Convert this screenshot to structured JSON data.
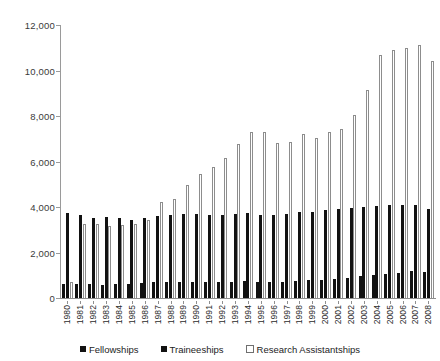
{
  "chart_data": {
    "type": "bar",
    "title": "",
    "xlabel": "",
    "ylabel": "",
    "ylim": [
      0,
      12000
    ],
    "ytick_values": [
      0,
      2000,
      4000,
      6000,
      8000,
      10000,
      12000
    ],
    "ytick_labels": [
      "0",
      "2,000",
      "4,000",
      "6,000",
      "8,000",
      "10,000",
      "12,000"
    ],
    "grid": false,
    "legend_position": "bottom",
    "categories": [
      "1980",
      "1981",
      "1982",
      "1983",
      "1984",
      "1985",
      "1986",
      "1987",
      "1988",
      "1989",
      "1990",
      "1991",
      "1992",
      "1993",
      "1994",
      "1995",
      "1996",
      "1997",
      "1998",
      "1999",
      "2000",
      "2001",
      "2002",
      "2003",
      "2004",
      "2005",
      "2006",
      "2007",
      "2008"
    ],
    "series": [
      {
        "name": "Fellowships",
        "color": "#121212",
        "values": [
          600,
          620,
          600,
          580,
          600,
          620,
          650,
          700,
          700,
          720,
          720,
          700,
          700,
          720,
          750,
          700,
          700,
          720,
          750,
          780,
          800,
          850,
          900,
          950,
          1000,
          1050,
          1100,
          1200,
          1150
        ]
      },
      {
        "name": "Traineeships",
        "color": "#121212",
        "values": [
          3750,
          3650,
          3500,
          3550,
          3500,
          3450,
          3500,
          3600,
          3650,
          3700,
          3700,
          3650,
          3650,
          3700,
          3750,
          3650,
          3650,
          3700,
          3800,
          3800,
          3850,
          3900,
          3950,
          4000,
          4050,
          4100,
          4100,
          4100,
          3900
        ]
      },
      {
        "name": "Research Assistantships",
        "color": "#ffffff",
        "values": [
          700,
          3250,
          3250,
          3150,
          3200,
          3250,
          3450,
          4200,
          4350,
          4950,
          5450,
          5750,
          6150,
          6750,
          7300,
          7300,
          6800,
          6850,
          7200,
          7050,
          7300,
          7450,
          8050,
          9150,
          10700,
          10900,
          11000,
          11100,
          10400
        ]
      }
    ]
  },
  "legend": {
    "items": [
      {
        "label": "Fellowships",
        "swatch": "filled-square-icon"
      },
      {
        "label": "Traineeships",
        "swatch": "filled-square-icon"
      },
      {
        "label": "Research Assistantships",
        "swatch": "open-square-icon"
      }
    ]
  }
}
